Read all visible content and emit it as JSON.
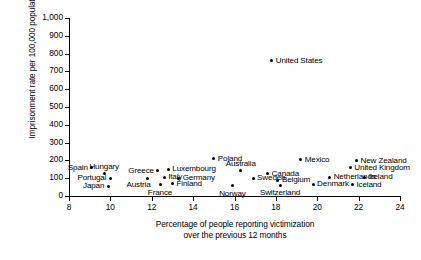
{
  "chart_data": {
    "type": "scatter",
    "title": "",
    "xlabel": "Percentage of people reporting victimization over the previous 12 months",
    "xlabel_line1": "Percentage of people reporting victimization",
    "xlabel_line2": "over the previous 12 months",
    "ylabel": "Imprisonment rate per 100,000 population",
    "xlim": [
      8,
      24
    ],
    "ylim": [
      0,
      1000
    ],
    "xticks": [
      8,
      10,
      12,
      14,
      16,
      18,
      20,
      22,
      24
    ],
    "xtick_labels": [
      "8",
      "10",
      "12",
      "14",
      "16",
      "18",
      "20",
      "22",
      "24"
    ],
    "yticks": [
      0,
      100,
      200,
      300,
      400,
      500,
      600,
      700,
      800,
      900,
      1000
    ],
    "ytick_labels": [
      "0",
      "100",
      "200",
      "300",
      "400",
      "500",
      "600",
      "700",
      "800",
      "900",
      "1,000"
    ],
    "grid": false,
    "legend": "none",
    "marker_color": "#000000",
    "points": [
      {
        "label": "Spain",
        "x": 9.1,
        "y": 160,
        "placement": "left"
      },
      {
        "label": "Hungary",
        "x": 9.7,
        "y": 125,
        "placement": "above"
      },
      {
        "label": "Portugal",
        "x": 10.0,
        "y": 100,
        "placement": "left"
      },
      {
        "label": "Japan",
        "x": 9.9,
        "y": 55,
        "placement": "left"
      },
      {
        "label": "Austria",
        "x": 11.8,
        "y": 100,
        "placement": "below-left"
      },
      {
        "label": "Greece",
        "x": 12.3,
        "y": 142,
        "placement": "left"
      },
      {
        "label": "Italy",
        "x": 12.6,
        "y": 105,
        "placement": "right"
      },
      {
        "label": "Luxembourg",
        "x": 12.8,
        "y": 150,
        "placement": "right"
      },
      {
        "label": "France",
        "x": 12.4,
        "y": 62,
        "placement": "below"
      },
      {
        "label": "Finland",
        "x": 13.0,
        "y": 68,
        "placement": "right"
      },
      {
        "label": "Germany",
        "x": 13.3,
        "y": 100,
        "placement": "right"
      },
      {
        "label": "Poland",
        "x": 15.0,
        "y": 208,
        "placement": "right"
      },
      {
        "label": "Australia",
        "x": 16.3,
        "y": 142,
        "placement": "above"
      },
      {
        "label": "Norway",
        "x": 15.9,
        "y": 58,
        "placement": "below"
      },
      {
        "label": "Sweden",
        "x": 16.9,
        "y": 100,
        "placement": "right"
      },
      {
        "label": "Canada",
        "x": 17.6,
        "y": 125,
        "placement": "right"
      },
      {
        "label": "Switzerland",
        "x": 18.2,
        "y": 60,
        "placement": "below"
      },
      {
        "label": "Belgium",
        "x": 18.1,
        "y": 88,
        "placement": "right"
      },
      {
        "label": "United States",
        "x": 17.8,
        "y": 760,
        "placement": "right"
      },
      {
        "label": "Mexico",
        "x": 19.2,
        "y": 205,
        "placement": "right"
      },
      {
        "label": "Denmark",
        "x": 19.8,
        "y": 65,
        "placement": "right"
      },
      {
        "label": "Netherlands",
        "x": 20.6,
        "y": 105,
        "placement": "right"
      },
      {
        "label": "New Zealand",
        "x": 21.9,
        "y": 198,
        "placement": "right"
      },
      {
        "label": "United Kingdom",
        "x": 21.6,
        "y": 160,
        "placement": "right"
      },
      {
        "label": "Ireland",
        "x": 22.3,
        "y": 105,
        "placement": "right"
      },
      {
        "label": "Iceland",
        "x": 21.7,
        "y": 62,
        "placement": "right"
      }
    ]
  }
}
